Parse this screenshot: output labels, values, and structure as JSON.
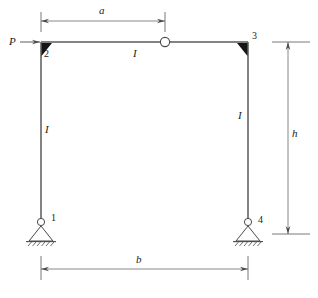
{
  "figure": {
    "type": "structural-frame-diagram",
    "stroke_color": "#4a4a4a",
    "text_color": "#1a1a1a",
    "background": "#ffffff"
  },
  "load": {
    "label": "P",
    "direction": "horizontal-right",
    "applied_at_node": "2"
  },
  "nodes": [
    {
      "id": "1",
      "label": "1",
      "support": "pin",
      "x": 41,
      "y": 222
    },
    {
      "id": "2",
      "label": "2",
      "support": "rigid-joint",
      "x": 41,
      "y": 42
    },
    {
      "id": "3",
      "label": "3",
      "support": "rigid-joint",
      "x": 248,
      "y": 42
    },
    {
      "id": "4",
      "label": "4",
      "support": "pin",
      "x": 248,
      "y": 222
    }
  ],
  "members": [
    {
      "name": "left-column",
      "stiffness_label": "I"
    },
    {
      "name": "beam",
      "stiffness_label": "I"
    },
    {
      "name": "right-column",
      "stiffness_label": "I"
    }
  ],
  "hinge": {
    "name": "internal-hinge",
    "shape": "open-circle",
    "x": 165,
    "y": 42
  },
  "dimensions": [
    {
      "name": "a",
      "label": "a",
      "orientation": "horizontal",
      "from": "node-2",
      "to": "internal-hinge"
    },
    {
      "name": "b",
      "label": "b",
      "orientation": "horizontal",
      "from": "node-1",
      "to": "node-4"
    },
    {
      "name": "h",
      "label": "h",
      "orientation": "vertical",
      "from": "beam",
      "to": "support-level"
    }
  ],
  "caption": {
    "text": ""
  }
}
